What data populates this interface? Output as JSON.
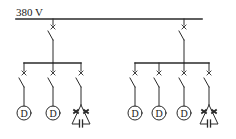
{
  "diagram": {
    "type": "single-line electrical distribution diagram",
    "bus": {
      "label": "380 V",
      "y": 19,
      "x1": 16,
      "x2": 202
    },
    "feeders": [
      {
        "id": "left",
        "x": 53,
        "breaker_y": 27,
        "subbus": {
          "y": 63,
          "x1": 24,
          "x2": 81
        },
        "branches": [
          {
            "x": 24,
            "load": "D",
            "load_type": "motor"
          },
          {
            "x": 53,
            "load": "D",
            "load_type": "motor"
          },
          {
            "x": 81,
            "load": "",
            "load_type": "capacitor-bank"
          }
        ]
      },
      {
        "id": "right",
        "x": 184,
        "breaker_y": 27,
        "subbus": {
          "y": 63,
          "x1": 135,
          "x2": 209
        },
        "branches": [
          {
            "x": 135,
            "load": "D",
            "load_type": "motor"
          },
          {
            "x": 159,
            "load": "D",
            "load_type": "motor"
          },
          {
            "x": 184,
            "load": "D",
            "load_type": "motor"
          },
          {
            "x": 209,
            "load": "",
            "load_type": "capacitor-bank"
          }
        ]
      }
    ],
    "colors": {
      "line": "#2a2a2a",
      "background": "#ffffff"
    }
  }
}
